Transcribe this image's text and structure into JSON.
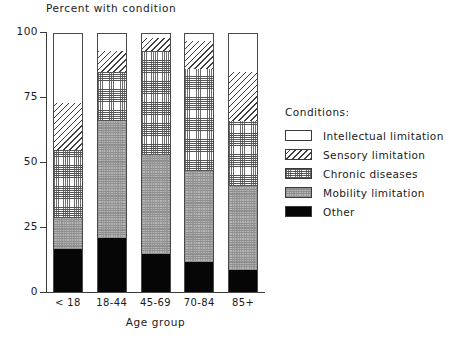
{
  "chart_data": {
    "type": "bar",
    "subtype": "stacked-bar-100",
    "title": "Percent with condition",
    "xlabel": "Age group",
    "ylabel": "",
    "categories": [
      "< 18",
      "18-44",
      "45-69",
      "70-84",
      "85+"
    ],
    "ylim": [
      0,
      100
    ],
    "yticks": [
      0,
      25,
      50,
      75,
      100
    ],
    "ytick_labels": [
      "0",
      "25",
      "50",
      "75",
      "100"
    ],
    "grid": false,
    "legend_position": "right",
    "legend_title": "Conditions:",
    "series": [
      {
        "name": "Other",
        "pattern": "solid-black",
        "color": "#060606",
        "values": [
          17,
          21,
          15,
          12,
          9
        ]
      },
      {
        "name": "Mobility limitation",
        "pattern": "dense-gray-stipple",
        "color": "#b6b6b6",
        "values": [
          12,
          45,
          38,
          35,
          32
        ]
      },
      {
        "name": "Chronic diseases",
        "pattern": "fine-crosshatch-grid",
        "color": "#ffffff",
        "values": [
          26,
          19,
          40,
          39,
          25
        ]
      },
      {
        "name": "Sensory limitation",
        "pattern": "diagonal-hatch",
        "color": "#ffffff",
        "values": [
          18,
          8,
          5,
          11,
          19
        ]
      },
      {
        "name": "Intellectual limitation",
        "pattern": "empty-white",
        "color": "#ffffff",
        "values": [
          27,
          7,
          2,
          3,
          15
        ]
      }
    ],
    "cumulative_tops": {
      "< 18": [
        17,
        29,
        55,
        73,
        100
      ],
      "18-44": [
        21,
        66,
        85,
        93,
        100
      ],
      "45-69": [
        15,
        53,
        93,
        98,
        100
      ],
      "70-84": [
        12,
        47,
        86,
        97,
        100
      ],
      "85+": [
        9,
        41,
        66,
        85,
        100
      ]
    }
  },
  "legend": {
    "title": "Conditions:",
    "items": [
      {
        "label": "Intellectual limitation",
        "swatch": "empty-white-swatch"
      },
      {
        "label": "Sensory limitation",
        "swatch": "diagonal-hatch-swatch"
      },
      {
        "label": "Chronic diseases",
        "swatch": "crosshatch-grid-swatch"
      },
      {
        "label": "Mobility limitation",
        "swatch": "gray-stipple-swatch"
      },
      {
        "label": "Other",
        "swatch": "solid-black-swatch"
      }
    ]
  }
}
